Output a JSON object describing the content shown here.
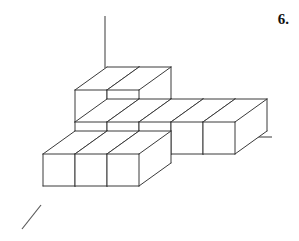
{
  "figure": {
    "label": "6.",
    "kind": "isometric-cube-stack",
    "cube_count": 10,
    "colors": {
      "edge": "#3a3a3a",
      "axis": "#5a5a5a",
      "face": "#ffffff",
      "background": "#ffffff",
      "label": "#111111"
    },
    "projection": {
      "face_size": 32,
      "depth_dx": 32,
      "depth_dy": -23
    },
    "axes": [
      {
        "name": "vertical-axis",
        "x1": 105,
        "y1": 16,
        "x2": 105,
        "y2": 68
      },
      {
        "name": "right-axis",
        "x1": 241,
        "y1": 137,
        "x2": 272,
        "y2": 137
      },
      {
        "name": "left-diagonal-axis",
        "x1": 41,
        "y1": 205,
        "x2": 22,
        "y2": 229
      }
    ],
    "cubes": [
      {
        "name": "cube-top-left",
        "x": 75,
        "y": 90,
        "tier": "upper"
      },
      {
        "name": "cube-top-right",
        "x": 107,
        "y": 90,
        "tier": "upper"
      },
      {
        "name": "cube-mid-left",
        "x": 75,
        "y": 122,
        "tier": "middle"
      },
      {
        "name": "cube-mid-center",
        "x": 107,
        "y": 122,
        "tier": "middle"
      },
      {
        "name": "cube-mid-right",
        "x": 139,
        "y": 122,
        "tier": "middle"
      },
      {
        "name": "cube-low-far-left",
        "x": 43,
        "y": 154,
        "tier": "lower"
      },
      {
        "name": "cube-low-left",
        "x": 75,
        "y": 154,
        "tier": "lower"
      },
      {
        "name": "cube-low-center",
        "x": 107,
        "y": 154,
        "tier": "lower"
      },
      {
        "name": "cube-right-near",
        "x": 171,
        "y": 122,
        "tier": "right-arm"
      },
      {
        "name": "cube-right-far",
        "x": 203,
        "y": 122,
        "tier": "right-arm"
      }
    ]
  }
}
